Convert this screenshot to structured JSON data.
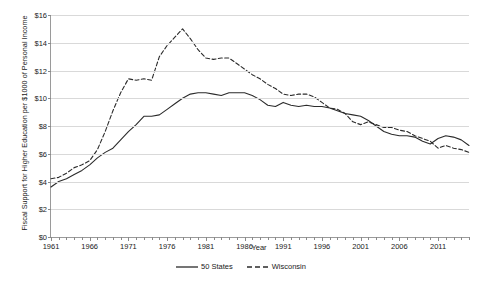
{
  "chart_data": {
    "type": "line",
    "title": "",
    "xlabel": "Year",
    "ylabel": "Fiscal Support for Higher Education per $1000 of Personal Income",
    "xlim": [
      1961,
      2015
    ],
    "ylim": [
      0,
      16
    ],
    "grid": true,
    "legend_position": "bottom-center",
    "x_tick_labels": [
      "1961",
      "1966",
      "1971",
      "1976",
      "1981",
      "1986",
      "1991",
      "1996",
      "2001",
      "2006",
      "2011"
    ],
    "x_tick_values": [
      1961,
      1966,
      1971,
      1976,
      1981,
      1986,
      1991,
      1996,
      2001,
      2006,
      2011
    ],
    "y_tick_labels": [
      "$0",
      "$2",
      "$4",
      "$6",
      "$8",
      "$10",
      "$12",
      "$14",
      "$16"
    ],
    "y_tick_values": [
      0,
      2,
      4,
      6,
      8,
      10,
      12,
      14,
      16
    ],
    "x": [
      1961,
      1962,
      1963,
      1964,
      1965,
      1966,
      1967,
      1968,
      1969,
      1970,
      1971,
      1972,
      1973,
      1974,
      1975,
      1976,
      1977,
      1978,
      1979,
      1980,
      1981,
      1982,
      1983,
      1984,
      1985,
      1986,
      1987,
      1988,
      1989,
      1990,
      1991,
      1992,
      1993,
      1994,
      1995,
      1996,
      1997,
      1998,
      1999,
      2000,
      2001,
      2002,
      2003,
      2004,
      2005,
      2006,
      2007,
      2008,
      2009,
      2010,
      2011,
      2012,
      2013,
      2014,
      2015
    ],
    "series": [
      {
        "name": "50 States",
        "style": "solid",
        "color": "#2b2b2b",
        "values": [
          3.6,
          4.0,
          4.2,
          4.5,
          4.8,
          5.2,
          5.7,
          6.1,
          6.4,
          7.0,
          7.6,
          8.1,
          8.7,
          8.7,
          8.8,
          9.2,
          9.6,
          10.0,
          10.3,
          10.4,
          10.4,
          10.3,
          10.2,
          10.4,
          10.4,
          10.4,
          10.2,
          9.9,
          9.5,
          9.4,
          9.7,
          9.5,
          9.4,
          9.5,
          9.4,
          9.4,
          9.3,
          9.1,
          8.9,
          8.8,
          8.7,
          8.4,
          8.0,
          7.6,
          7.4,
          7.3,
          7.3,
          7.2,
          6.9,
          6.7,
          7.1,
          7.3,
          7.2,
          7.0,
          6.6
        ]
      },
      {
        "name": "Wisconsin",
        "style": "dashed",
        "color": "#2b2b2b",
        "values": [
          4.2,
          4.3,
          4.6,
          5.0,
          5.2,
          5.5,
          6.3,
          7.6,
          9.1,
          10.4,
          11.4,
          11.3,
          11.4,
          11.3,
          13.0,
          13.8,
          14.4,
          15.0,
          14.3,
          13.5,
          12.9,
          12.8,
          12.9,
          12.9,
          12.5,
          12.1,
          11.7,
          11.4,
          11.0,
          10.7,
          10.3,
          10.2,
          10.3,
          10.3,
          10.1,
          9.7,
          9.3,
          9.2,
          8.9,
          8.3,
          8.1,
          8.3,
          8.1,
          7.9,
          7.9,
          7.7,
          7.6,
          7.3,
          7.1,
          6.9,
          6.4,
          6.6,
          6.4,
          6.3,
          6.1
        ]
      }
    ]
  },
  "legend": {
    "items": [
      {
        "label": "50 States",
        "style": "solid"
      },
      {
        "label": "Wisconsin",
        "style": "dashed"
      }
    ]
  }
}
